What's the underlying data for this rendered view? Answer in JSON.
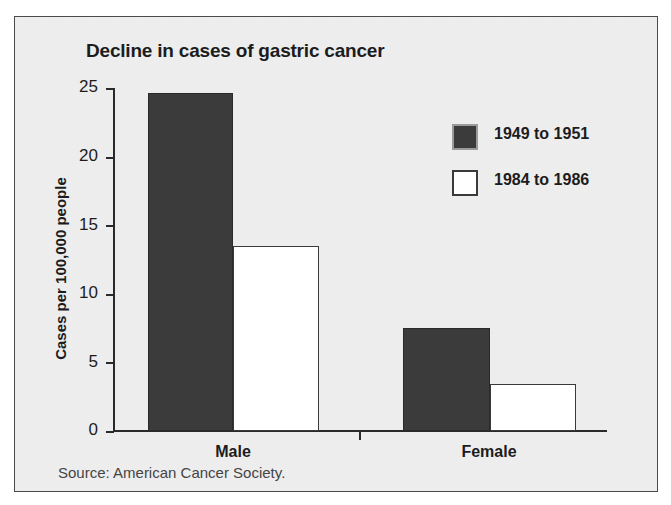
{
  "chart_data": {
    "type": "bar",
    "title": "Decline in cases of gastric cancer",
    "xlabel": "",
    "ylabel": "Cases per 100,000 people",
    "categories": [
      "Male",
      "Female"
    ],
    "series": [
      {
        "name": "1949 to 1951",
        "values": [
          24.6,
          7.5
        ],
        "color": "#3b3b3b"
      },
      {
        "name": "1984 to 1986",
        "values": [
          13.5,
          3.4
        ],
        "color": "#ffffff"
      }
    ],
    "ylim": [
      0,
      25
    ],
    "yticks": [
      0,
      5,
      10,
      15,
      20,
      25
    ],
    "ytick_labels": [
      "0",
      "5",
      "10",
      "15",
      "20",
      "25"
    ],
    "grid": false,
    "legend_position": "upper right",
    "source": "Source: American Cancer Society."
  },
  "legend": {
    "entries": [
      {
        "label": "1949 to 1951",
        "swatch": "dark-filled-square"
      },
      {
        "label": "1984 to 1986",
        "swatch": "white-outlined-square"
      }
    ]
  },
  "axis": {
    "y_title": "Cases per 100,000 people",
    "ticks": [
      "25",
      "20",
      "15",
      "10",
      "5",
      "0"
    ],
    "categories": [
      "Male",
      "Female"
    ]
  },
  "footer": {
    "source": "Source: American Cancer Society."
  },
  "colors": {
    "panel_background": "#eeeeee",
    "page_background": "#ffffff",
    "frame": "#4a4a4a",
    "ink": "#1c1c1c",
    "axis": "#2a2a2a",
    "series_old": "#3b3b3b",
    "series_new": "#ffffff"
  }
}
